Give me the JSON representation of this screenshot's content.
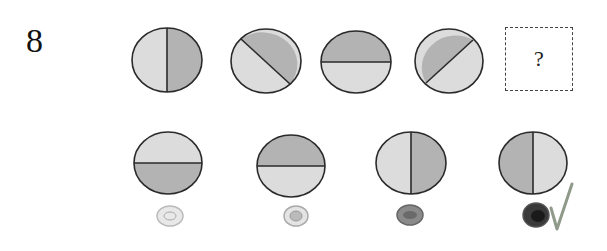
{
  "question": {
    "number": "8",
    "placeholder": "?"
  },
  "colors": {
    "light": "#dcdcdc",
    "dark": "#b3b3b3",
    "stroke": "#2a2a2a"
  },
  "sequence": [
    {
      "split": "vertical",
      "left": "light",
      "right": "dark"
    },
    {
      "split": "diagonal-down",
      "upper": "dark",
      "lower": "light"
    },
    {
      "split": "horizontal",
      "top": "dark",
      "bottom": "light"
    },
    {
      "split": "diagonal-up",
      "upper": "dark",
      "lower": "light"
    },
    {
      "split": "unknown",
      "label": "?"
    }
  ],
  "options": [
    {
      "split": "horizontal",
      "top": "light",
      "bottom": "dark",
      "bubble": "unfilled"
    },
    {
      "split": "horizontal",
      "top": "dark",
      "bottom": "light",
      "bubble": "unfilled"
    },
    {
      "split": "vertical",
      "left": "light",
      "right": "dark",
      "bubble": "partially-filled"
    },
    {
      "split": "vertical",
      "left": "dark",
      "right": "light",
      "bubble": "filled",
      "checkmark": true
    }
  ]
}
